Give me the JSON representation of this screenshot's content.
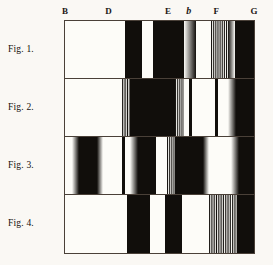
{
  "plate": {
    "title": "Absorption spectra plate",
    "background_color": "#faf8f4",
    "ink_color": "#14100d",
    "frame_color": "#4a4038",
    "paper_color": "#fdfcf8"
  },
  "scale": {
    "name": "fraunhofer-line-scale",
    "labels": [
      {
        "text": "B",
        "x_pct": 0.0,
        "flat": false
      },
      {
        "text": "D",
        "x_pct": 23.0,
        "flat": false
      },
      {
        "text": "E",
        "x_pct": 54.5,
        "flat": false
      },
      {
        "text": "b",
        "x_pct": 65.5,
        "flat": true
      },
      {
        "text": "F",
        "x_pct": 80.0,
        "flat": false
      },
      {
        "text": "G",
        "x_pct": 100.0,
        "flat": false
      }
    ]
  },
  "figures": [
    {
      "label": "Fig. 1.",
      "name": "figure-1",
      "bands": [
        {
          "kind": "light",
          "start": 0.0,
          "end": 32.0
        },
        {
          "kind": "dark",
          "start": 32.0,
          "end": 41.0
        },
        {
          "kind": "light",
          "start": 41.0,
          "end": 46.5
        },
        {
          "kind": "dark",
          "start": 46.5,
          "end": 63.0
        },
        {
          "kind": "grad-r",
          "start": 63.0,
          "end": 69.5
        },
        {
          "kind": "light",
          "start": 69.5,
          "end": 77.0
        },
        {
          "kind": "stripe",
          "start": 77.0,
          "end": 86.0,
          "lines": 9
        },
        {
          "kind": "grad-l",
          "start": 86.0,
          "end": 90.0
        },
        {
          "kind": "dark",
          "start": 90.0,
          "end": 100.0
        }
      ]
    },
    {
      "label": "Fig. 2.",
      "name": "figure-2",
      "bands": [
        {
          "kind": "light",
          "start": 0.0,
          "end": 30.0
        },
        {
          "kind": "stripe",
          "start": 30.0,
          "end": 34.5,
          "lines": 5
        },
        {
          "kind": "dark",
          "start": 34.5,
          "end": 58.0
        },
        {
          "kind": "stripe",
          "start": 58.0,
          "end": 63.0,
          "lines": 5
        },
        {
          "kind": "light",
          "start": 63.0,
          "end": 65.5
        },
        {
          "kind": "dark",
          "start": 65.5,
          "end": 67.0
        },
        {
          "kind": "light",
          "start": 67.0,
          "end": 79.5
        },
        {
          "kind": "dark",
          "start": 79.5,
          "end": 80.8
        },
        {
          "kind": "light",
          "start": 80.8,
          "end": 86.5
        },
        {
          "kind": "grad-r",
          "start": 86.5,
          "end": 90.5
        },
        {
          "kind": "dark",
          "start": 90.5,
          "end": 100.0
        }
      ]
    },
    {
      "label": "Fig. 3.",
      "name": "figure-3",
      "bands": [
        {
          "kind": "light",
          "start": 0.0,
          "end": 3.5
        },
        {
          "kind": "grad-r",
          "start": 3.5,
          "end": 7.5
        },
        {
          "kind": "dark",
          "start": 7.5,
          "end": 17.0
        },
        {
          "kind": "grad-l",
          "start": 17.0,
          "end": 20.0
        },
        {
          "kind": "light",
          "start": 20.0,
          "end": 30.0
        },
        {
          "kind": "dark",
          "start": 30.0,
          "end": 32.0
        },
        {
          "kind": "light",
          "start": 32.0,
          "end": 34.5
        },
        {
          "kind": "grad-r",
          "start": 34.5,
          "end": 38.5
        },
        {
          "kind": "dark",
          "start": 38.5,
          "end": 48.0
        },
        {
          "kind": "light",
          "start": 48.0,
          "end": 54.0
        },
        {
          "kind": "stripe",
          "start": 54.0,
          "end": 58.0,
          "lines": 4
        },
        {
          "kind": "dark",
          "start": 58.0,
          "end": 73.0
        },
        {
          "kind": "grad-l",
          "start": 73.0,
          "end": 76.0
        },
        {
          "kind": "light",
          "start": 76.0,
          "end": 88.0
        },
        {
          "kind": "grad-r",
          "start": 88.0,
          "end": 92.0
        },
        {
          "kind": "dark",
          "start": 92.0,
          "end": 100.0
        }
      ]
    },
    {
      "label": "Fig. 4.",
      "name": "figure-4",
      "bands": [
        {
          "kind": "light",
          "start": 0.0,
          "end": 31.0
        },
        {
          "kind": "light",
          "start": 31.0,
          "end": 33.0
        },
        {
          "kind": "dark",
          "start": 33.0,
          "end": 45.0
        },
        {
          "kind": "light",
          "start": 45.0,
          "end": 53.0
        },
        {
          "kind": "dark",
          "start": 53.0,
          "end": 62.0
        },
        {
          "kind": "light",
          "start": 62.0,
          "end": 76.0
        },
        {
          "kind": "stripe",
          "start": 76.0,
          "end": 91.0,
          "lines": 16
        },
        {
          "kind": "dark",
          "start": 91.0,
          "end": 100.0
        }
      ]
    }
  ]
}
